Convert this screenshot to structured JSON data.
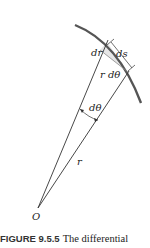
{
  "figure": {
    "labels": {
      "dr": "dr",
      "ds": "ds",
      "r_dtheta": "r dθ",
      "dtheta": "dθ",
      "r": "r",
      "origin": "O"
    },
    "caption": {
      "number": "FIGURE 9.5.5",
      "text": "The differential"
    },
    "colors": {
      "arc": "#555555",
      "lines": "#333333",
      "shade": "#e6e6e6"
    }
  }
}
